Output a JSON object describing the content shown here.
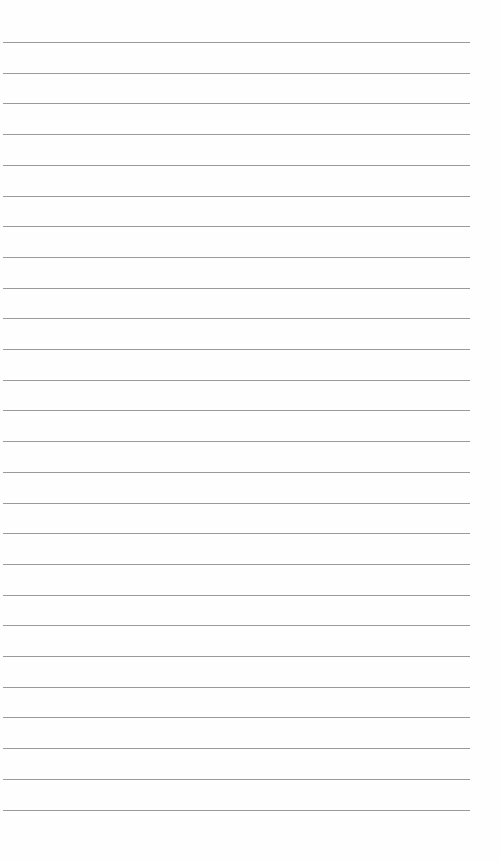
{
  "page": {
    "type": "lined-paper",
    "background_color": "#fefefe",
    "rule_color": "#9a9a9a",
    "rule_count": 26,
    "first_rule_y": 42,
    "rule_spacing": 30.7,
    "rule_left": 3,
    "rule_width": 467
  }
}
